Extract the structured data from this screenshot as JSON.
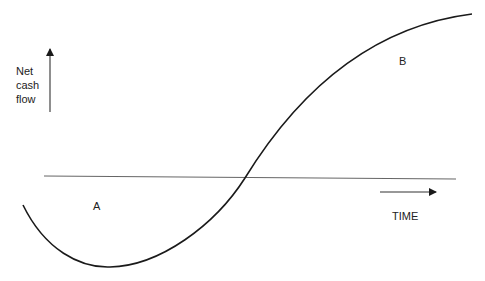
{
  "diagram": {
    "y_axis_label_lines": [
      "Net",
      "cash",
      "flow"
    ],
    "x_axis_label": "TIME",
    "region_labels": {
      "negative": "A",
      "positive": "B"
    },
    "colors": {
      "curve": "#1a1a1a",
      "baseline": "#555555",
      "arrows": "#1a1a1a",
      "background": "#ffffff"
    }
  }
}
